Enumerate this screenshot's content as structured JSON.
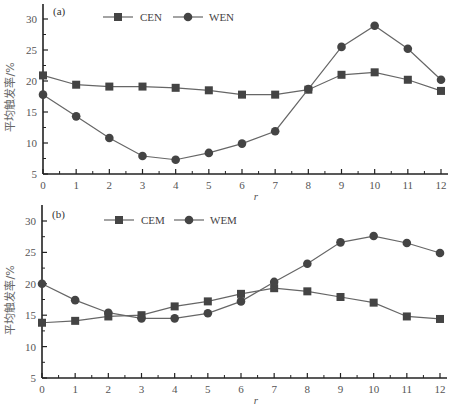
{
  "colors": {
    "axis": "#222222",
    "line": "#666666",
    "marker": "#444444",
    "text": "#555555"
  },
  "chart_data": [
    {
      "type": "line",
      "panel_label": "(a)",
      "title": "",
      "xlabel": "r",
      "ylabel": "平均触发率/%",
      "x": [
        0,
        1,
        2,
        3,
        4,
        5,
        6,
        7,
        8,
        9,
        10,
        11,
        12
      ],
      "xticks": [
        "0",
        "1",
        "2",
        "3",
        "4",
        "5",
        "6",
        "7",
        "8",
        "9",
        "10",
        "11",
        "12"
      ],
      "yticks": [
        "5",
        "10",
        "15",
        "20",
        "25",
        "30"
      ],
      "xlim": [
        0,
        12
      ],
      "ylim": [
        5,
        31
      ],
      "grid": false,
      "legend_position": "top",
      "series": [
        {
          "name": "CEN",
          "marker": "square",
          "values": [
            20.9,
            19.4,
            19.1,
            19.1,
            18.9,
            18.5,
            17.8,
            17.8,
            18.6,
            21.0,
            21.4,
            20.2,
            18.4
          ]
        },
        {
          "name": "WEN",
          "marker": "circle",
          "values": [
            17.8,
            14.3,
            10.8,
            7.9,
            7.3,
            8.4,
            9.9,
            11.9,
            18.7,
            25.5,
            28.9,
            25.2,
            20.2
          ]
        }
      ]
    },
    {
      "type": "line",
      "panel_label": "(b)",
      "title": "",
      "xlabel": "r",
      "ylabel": "平均触发率/%",
      "x": [
        0,
        1,
        2,
        3,
        4,
        5,
        6,
        7,
        8,
        9,
        10,
        11,
        12
      ],
      "xticks": [
        "0",
        "1",
        "2",
        "3",
        "4",
        "5",
        "6",
        "7",
        "8",
        "9",
        "10",
        "11",
        "12"
      ],
      "yticks": [
        "5",
        "10",
        "15",
        "20",
        "25",
        "30"
      ],
      "xlim": [
        0,
        12
      ],
      "ylim": [
        5,
        31
      ],
      "grid": false,
      "legend_position": "top",
      "series": [
        {
          "name": "CEM",
          "marker": "square",
          "values": [
            13.8,
            14.1,
            14.8,
            15.0,
            16.4,
            17.2,
            18.4,
            19.3,
            18.8,
            17.9,
            17.0,
            14.8,
            14.4
          ]
        },
        {
          "name": "WEM",
          "marker": "circle",
          "values": [
            20.0,
            17.4,
            15.4,
            14.5,
            14.5,
            15.3,
            17.2,
            20.3,
            23.2,
            26.6,
            27.6,
            26.5,
            24.9
          ]
        }
      ]
    }
  ]
}
